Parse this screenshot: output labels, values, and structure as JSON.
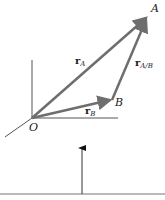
{
  "diagram": {
    "points": {
      "origin": {
        "label": "O"
      },
      "a": {
        "label": "A"
      },
      "b": {
        "label": "B"
      }
    },
    "vectors": {
      "r_a": {
        "symbol": "r",
        "subscript": "A"
      },
      "r_b": {
        "symbol": "r",
        "subscript": "B"
      },
      "r_ab": {
        "symbol": "r",
        "subscript": "A/B"
      }
    },
    "colors": {
      "vector": "#6e6e6e",
      "axis": "#555555",
      "text": "#222222"
    }
  }
}
